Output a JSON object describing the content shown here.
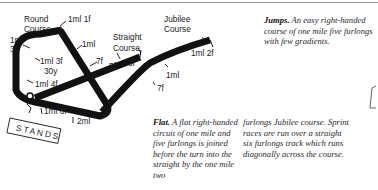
{
  "map": {
    "courses": {
      "round": "Round Course",
      "straight": "Straight Course",
      "jubilee": "Jubilee Course"
    },
    "distance_markers": [
      {
        "id": "round-1ml-1f",
        "text": "1ml 1f"
      },
      {
        "id": "round-1ml-3f-outer",
        "line1": "1ml",
        "line2": "3f"
      },
      {
        "id": "round-1ml",
        "text": "1ml"
      },
      {
        "id": "round-1ml-3f-30y",
        "line1": "1ml 3f",
        "line2": "30y"
      },
      {
        "id": "round-7f",
        "text": "7f"
      },
      {
        "id": "round-1ml-4f",
        "text": "1ml 4f"
      },
      {
        "id": "straight-5f",
        "text": "5f"
      },
      {
        "id": "straight-6f",
        "text": "6f"
      },
      {
        "id": "jubilee-1ml-2f",
        "text": "1ml 2f"
      },
      {
        "id": "jubilee-1ml",
        "text": "1ml"
      },
      {
        "id": "jubilee-7f",
        "text": "7f"
      },
      {
        "id": "home-1ml-6f",
        "text": "1ml 6f"
      },
      {
        "id": "home-2ml",
        "text": "2ml"
      }
    ],
    "stands_label": "STANDS",
    "track_color": "#111111"
  },
  "descriptions": {
    "jumps": {
      "heading": "Jumps.",
      "body": "An easy right-handed course of one mile five furlongs with few gradients."
    },
    "flat": {
      "heading": "Flat.",
      "body_col1": "A flat right-handed circuit of one mile and five furlongs is joined before the turn into the straight by the one mile two",
      "body_col2": "furlongs Jubilee course. Sprint races are run over a straight six furlongs track which runs diagonally across the course."
    }
  }
}
